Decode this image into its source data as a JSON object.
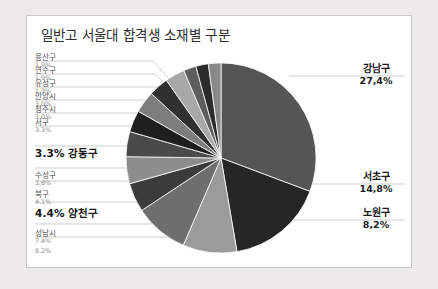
{
  "panel": {
    "title": "일반고 서울대 합격생 소재별 구분"
  },
  "chart_data": {
    "type": "pie",
    "title": "일반고 서울대 합격생 소재별 구분",
    "xlabel": "",
    "ylabel": "",
    "legend": "none",
    "grid": false,
    "unit": "%",
    "categories": [
      "강남구",
      "서초구",
      "노원구",
      "성남시",
      "양천구",
      "북구",
      "수성구",
      "강동구",
      "서구",
      "청주시",
      "안양시",
      "유성구",
      "연수구",
      "용산구"
    ],
    "values": [
      27.4,
      14.8,
      8.2,
      8.2,
      4.4,
      4.1,
      3.8,
      3.3,
      3.3,
      3.0,
      3.0,
      1.9,
      1.9,
      1.9
    ],
    "slices": [
      {
        "name": "강남구",
        "value": 27.4,
        "label": "27,4%",
        "color": "#555555",
        "emphasis": "right"
      },
      {
        "name": "서초구",
        "value": 14.8,
        "label": "14,8%",
        "color": "#262626",
        "emphasis": "right"
      },
      {
        "name": "노원구",
        "value": 8.2,
        "label": "8,2%",
        "color": "#9b9b9b",
        "emphasis": "right"
      },
      {
        "name": "성남시",
        "value": 8.2,
        "label": "8.2%",
        "color": "#6e6e6e",
        "emphasis": "small"
      },
      {
        "name": "양천구",
        "value": 4.4,
        "label": "4.4%",
        "color": "#3b3b3b",
        "emphasis": "bold"
      },
      {
        "name": "북구",
        "value": 4.1,
        "label": "4.1%",
        "color": "#8d8d8d",
        "emphasis": "small"
      },
      {
        "name": "수성구",
        "value": 3.8,
        "label": "3.8%",
        "color": "#4a4a4a",
        "emphasis": "small"
      },
      {
        "name": "강동구",
        "value": 3.3,
        "label": "3.3%",
        "color": "#1f1f1f",
        "emphasis": "bold"
      },
      {
        "name": "서구",
        "value": 3.3,
        "label": "3.3%",
        "color": "#7d7d7d",
        "emphasis": "small"
      },
      {
        "name": "청주시",
        "value": 3.0,
        "label": "3.0%",
        "color": "#303030",
        "emphasis": "small"
      },
      {
        "name": "안양시",
        "value": 3.0,
        "label": "3.0%",
        "color": "#a8a8a8",
        "emphasis": "small"
      },
      {
        "name": "유성구",
        "value": 1.9,
        "label": "1.9%",
        "color": "#5e5e5e",
        "emphasis": "small"
      },
      {
        "name": "연수구",
        "value": 1.9,
        "label": "1.9%",
        "color": "#2b2b2b",
        "emphasis": "small"
      },
      {
        "name": "용산구",
        "value": 1.9,
        "label": "1.9%",
        "color": "#888888",
        "emphasis": "small"
      }
    ]
  },
  "labels": {
    "left_small": [
      {
        "pct": "1.9%",
        "name": "용산구"
      },
      {
        "pct": "1.9%",
        "name": "연수구"
      },
      {
        "pct": "1.9%",
        "name": "유성구"
      },
      {
        "pct": "3.0%",
        "name": "안양시"
      },
      {
        "pct": "3.0%",
        "name": "청주시"
      },
      {
        "pct": "3.3%",
        "name": "서구"
      },
      {
        "pct": "3.8%",
        "name": "수성구"
      },
      {
        "pct": "4.1%",
        "name": "북구"
      },
      {
        "pct": "7.4%",
        "name": "성남시"
      },
      {
        "pct": "8.2%",
        "name": ""
      }
    ],
    "left_bold": [
      {
        "text": "3.3% 강동구"
      },
      {
        "text": "4.4% 양천구"
      }
    ],
    "right": [
      {
        "name": "강남구",
        "pct": "27,4%"
      },
      {
        "name": "서초구",
        "pct": "14,8%"
      },
      {
        "name": "노원구",
        "pct": "8,2%"
      }
    ]
  },
  "colors": {
    "page_background": "#eceaea",
    "panel_background": "#ffffff",
    "panel_border": "#c9c9c9",
    "leader_line": "#b4b4b4",
    "title_text": "#2d2d2d"
  }
}
